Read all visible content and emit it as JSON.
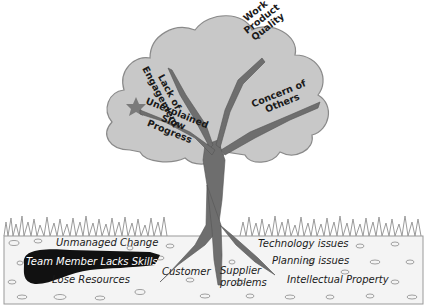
{
  "diagram": {
    "type": "tree-metaphor",
    "canopy": {
      "labels": [
        {
          "id": "lack-of-engagement",
          "text": "Lack of Engagement",
          "lines": [
            "Lack of",
            "Engagement"
          ]
        },
        {
          "id": "work-product-quality",
          "text": "Work Product Quality",
          "lines": [
            "Work",
            "Product",
            "Quality"
          ]
        },
        {
          "id": "unexplained-slow-progress",
          "text": "Unexplained Slow Progress",
          "lines": [
            "Unexplained",
            "Slow",
            "Progress"
          ]
        },
        {
          "id": "concern-of-others",
          "text": "Concern of Others",
          "lines": [
            "Concern of",
            "Others"
          ]
        }
      ]
    },
    "roots": {
      "labels": [
        {
          "id": "unmanaged-change",
          "text": "Unmanaged Change"
        },
        {
          "id": "team-member-lacks-skills",
          "text": "Team Member Lacks Skills",
          "highlighted": true
        },
        {
          "id": "lose-resources",
          "text": "Lose Resources"
        },
        {
          "id": "customer",
          "text": "Customer"
        },
        {
          "id": "supplier-problems",
          "text": "Supplier problems",
          "lines": [
            "Supplier",
            "problems"
          ]
        },
        {
          "id": "technology-issues",
          "text": "Technology issues"
        },
        {
          "id": "planning-issues",
          "text": "Planning issues"
        },
        {
          "id": "intellectual-property",
          "text": "Intellectual Property"
        }
      ]
    },
    "colors": {
      "canopy_fill": "#c8c8c8",
      "canopy_stroke": "#8a8a8a",
      "trunk": "#6e6e6e",
      "star": "#7a7a7a",
      "soil_fill": "#f4f4f4",
      "highlight_blob": "#111111",
      "grass": "#9a9a9a"
    }
  }
}
